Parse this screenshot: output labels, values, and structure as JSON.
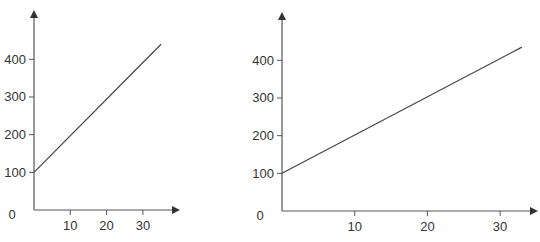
{
  "chart_data": [
    {
      "type": "line",
      "title": "",
      "xlabel": "",
      "ylabel": "",
      "x_ticks": [
        10,
        20,
        30
      ],
      "y_ticks": [
        0,
        100,
        200,
        300,
        400
      ],
      "xlim": [
        0,
        40
      ],
      "ylim": [
        0,
        480
      ],
      "grid": false,
      "legend": null,
      "series": [
        {
          "name": "line",
          "x": [
            0,
            35
          ],
          "y": [
            100,
            440
          ]
        }
      ],
      "axis_color": "#555555",
      "line_color": "#444444"
    },
    {
      "type": "line",
      "title": "",
      "xlabel": "",
      "ylabel": "",
      "x_ticks": [
        10,
        20,
        30
      ],
      "y_ticks": [
        0,
        100,
        200,
        300,
        400
      ],
      "xlim": [
        0,
        35
      ],
      "ylim": [
        0,
        480
      ],
      "grid": false,
      "legend": null,
      "series": [
        {
          "name": "line",
          "x": [
            0,
            33
          ],
          "y": [
            100,
            435
          ]
        }
      ],
      "axis_color": "#555555",
      "line_color": "#444444"
    }
  ],
  "charts": [
    {
      "layout": {
        "ox": 34,
        "oy": 210,
        "xScale": 3.63,
        "yScale": 0.3767,
        "xEnd": 180,
        "yTop": 10,
        "zeroLabelX": 12
      },
      "y_tick_labels": [
        "0",
        "100",
        "200",
        "300",
        "400"
      ],
      "x_tick_labels": [
        "10",
        "20",
        "30"
      ]
    },
    {
      "layout": {
        "ox": 282,
        "oy": 211,
        "xScale": 7.27,
        "yScale": 0.3767,
        "xEnd": 538,
        "yTop": 12,
        "zeroLabelX": 260
      },
      "y_tick_labels": [
        "0",
        "100",
        "200",
        "300",
        "400"
      ],
      "x_tick_labels": [
        "10",
        "20",
        "30"
      ]
    }
  ]
}
